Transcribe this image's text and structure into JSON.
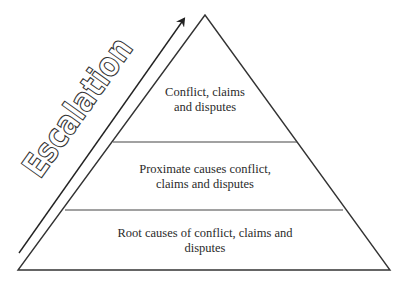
{
  "diagram": {
    "type": "pyramid",
    "axis_label": "Escalation",
    "tiers": [
      {
        "level": "top",
        "label": "Conflict, claims\nand disputes"
      },
      {
        "level": "middle",
        "label": "Proximate causes conflict,\nclaims and disputes"
      },
      {
        "level": "bottom",
        "label": "Root causes of conflict, claims and\ndisputes"
      }
    ],
    "colors": {
      "stroke": "#333333",
      "text": "#2a2a2a",
      "background": "#ffffff"
    }
  }
}
